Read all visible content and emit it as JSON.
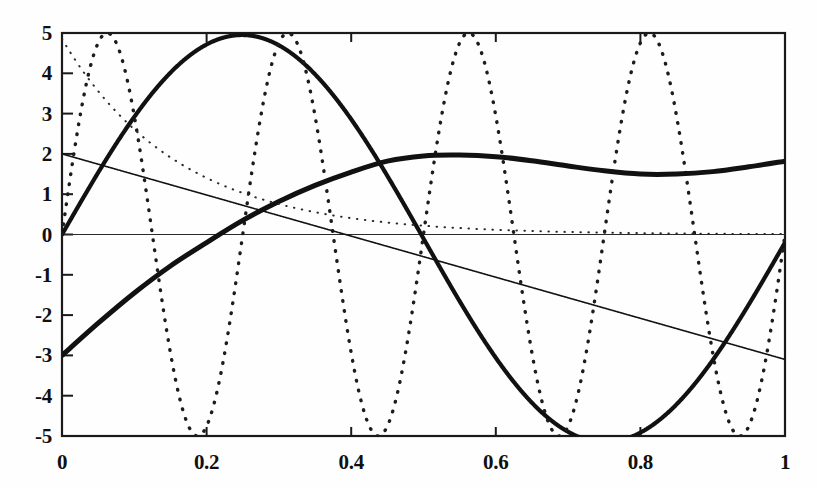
{
  "chart_data": {
    "type": "line",
    "title": "",
    "xlabel": "",
    "ylabel": "",
    "xlim": [
      0,
      1
    ],
    "ylim": [
      -5,
      5
    ],
    "grid": false,
    "legend": "none",
    "xticks": [
      0,
      0.2,
      0.4,
      0.6,
      0.8,
      1
    ],
    "xtick_labels": [
      "0",
      "0.2",
      "0.4",
      "0.6",
      "0.8",
      "1"
    ],
    "yticks": [
      5,
      4,
      3,
      2,
      1,
      0,
      -1,
      -2,
      -3,
      -4,
      -5
    ],
    "ytick_labels": [
      "5",
      "4",
      "3",
      "2",
      "1",
      "0",
      "-1",
      "-2",
      "-3",
      "-4",
      "-5"
    ],
    "zero_line": 0,
    "series": [
      {
        "name": "bold-sine",
        "style": "solid",
        "width": 4.2,
        "color": "#111111",
        "expression": "5*sin(2*pi*x)",
        "x": [
          0,
          0.05,
          0.1,
          0.15,
          0.2,
          0.25,
          0.3,
          0.35,
          0.4,
          0.45,
          0.5,
          0.55,
          0.6,
          0.65,
          0.7,
          0.75,
          0.8,
          0.85,
          0.9,
          0.95,
          1
        ],
        "values": [
          0,
          1.55,
          2.94,
          4.05,
          4.76,
          5,
          4.76,
          4.05,
          2.94,
          1.55,
          0,
          -1.55,
          -2.94,
          -4.05,
          -4.76,
          -5,
          -4.76,
          -4.05,
          -2.94,
          -1.55,
          -0.2
        ]
      },
      {
        "name": "dotted-high-frequency-sine",
        "style": "dotted",
        "width": 3.4,
        "color": "#1c1c1c",
        "expression": "5*sin(8*pi*x)",
        "x": [
          0,
          0.0625,
          0.125,
          0.1875,
          0.25,
          0.3125,
          0.375,
          0.4375,
          0.5,
          0.5625,
          0.625,
          0.6875,
          0.75,
          0.8125,
          0.875,
          0.9375,
          1
        ],
        "values": [
          0,
          5,
          0,
          -5,
          0,
          5,
          0,
          -5,
          0,
          5,
          0,
          -5,
          0,
          5,
          0,
          -5,
          0
        ]
      },
      {
        "name": "thin-declining-line",
        "style": "solid",
        "width": 1.6,
        "color": "#121212",
        "expression": "2 - 5.1*x",
        "x": [
          0,
          1
        ],
        "values": [
          2,
          -3.1
        ]
      },
      {
        "name": "thick-slow-curve",
        "style": "solid",
        "width": 5.0,
        "color": "#111111",
        "expression": "damped rising curve from -3 to ~1.8",
        "x": [
          0,
          0.05,
          0.1,
          0.15,
          0.2,
          0.25,
          0.3,
          0.35,
          0.4,
          0.45,
          0.5,
          0.55,
          0.6,
          0.65,
          0.7,
          0.75,
          0.8,
          0.85,
          0.9,
          0.95,
          1
        ],
        "values": [
          -3.0,
          -2.2,
          -1.45,
          -0.78,
          -0.2,
          0.35,
          0.82,
          1.22,
          1.55,
          1.82,
          1.95,
          1.97,
          1.93,
          1.83,
          1.7,
          1.58,
          1.5,
          1.5,
          1.56,
          1.68,
          1.82
        ]
      },
      {
        "name": "fine-dotted-decay-curve",
        "style": "fine-dotted",
        "width": 2.0,
        "color": "#2a2a2a",
        "expression": "4.85*exp(-6.2*x)",
        "x": [
          0,
          0.04,
          0.08,
          0.12,
          0.16,
          0.2,
          0.25,
          0.3,
          0.35,
          0.4,
          0.45,
          0.5,
          0.6,
          0.7,
          0.8,
          0.9,
          1
        ],
        "values": [
          4.85,
          3.78,
          2.95,
          2.31,
          1.8,
          1.4,
          1.03,
          0.75,
          0.55,
          0.41,
          0.3,
          0.22,
          0.12,
          0.06,
          0.03,
          0.02,
          0.01
        ]
      }
    ]
  },
  "plot_area": {
    "left": 62,
    "top": 33,
    "right": 785,
    "bottom": 436,
    "frame_color": "#1a1a1a",
    "background": "#fefefe"
  }
}
